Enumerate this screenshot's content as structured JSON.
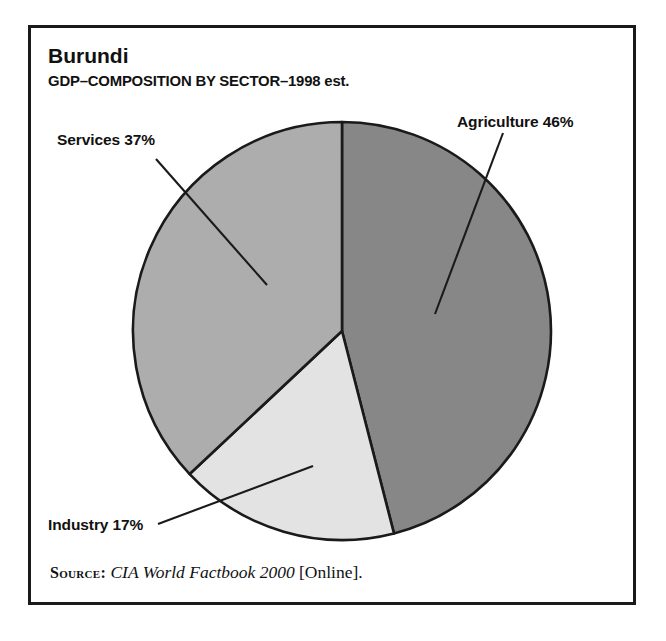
{
  "frame": {
    "border_color": "#1a1a1a"
  },
  "header": {
    "title": "Burundi",
    "subtitle": "GDP–COMPOSITION BY SECTOR–1998 est."
  },
  "source": {
    "prefix": "Source:",
    "title": "CIA World Factbook 2000",
    "suffix": "[Online]."
  },
  "labels": {
    "agriculture": "Agriculture 46%",
    "industry": "Industry 17%",
    "services": "Services 37%"
  },
  "chart_data": {
    "type": "pie",
    "title": "Burundi",
    "subtitle": "GDP–COMPOSITION BY SECTOR–1998 est.",
    "xlabel": "",
    "ylabel": "",
    "categories": [
      "Agriculture",
      "Industry",
      "Services"
    ],
    "values": [
      46,
      17,
      37
    ],
    "unit": "percent",
    "labels": [
      "Agriculture 46%",
      "Industry 17%",
      "Services 37%"
    ],
    "colors": [
      "#878787",
      "#e3e3e3",
      "#adadad"
    ],
    "slice_outline_color": "#1a1a1a",
    "start_angle_deg": 0,
    "direction": "clockwise",
    "legend": "none",
    "grid": false,
    "annotations": [
      {
        "text": "Agriculture 46%",
        "slice": "Agriculture",
        "leader_line": true
      },
      {
        "text": "Industry 17%",
        "slice": "Industry",
        "leader_line": true
      },
      {
        "text": "Services 37%",
        "slice": "Services",
        "leader_line": true
      }
    ],
    "geometry": {
      "center_x": 342,
      "center_y": 331,
      "radius": 209
    }
  }
}
